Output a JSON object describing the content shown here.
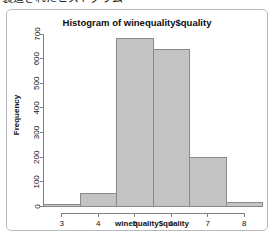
{
  "caption": {
    "text": "製造されたヒストグラム"
  },
  "chart_data": {
    "type": "bar",
    "title": "Histogram of winequality$quality",
    "xlabel": "winequality$quality",
    "ylabel": "Frequency",
    "categories": [
      "3",
      "4",
      "5",
      "6",
      "7",
      "8"
    ],
    "values": [
      10,
      53,
      681,
      638,
      199,
      18
    ],
    "x": [
      3,
      4,
      5,
      6,
      7,
      8
    ],
    "xlim": [
      2.5,
      8.5
    ],
    "ylim": [
      0,
      700
    ],
    "xticks": [
      "3",
      "4",
      "5",
      "6",
      "7",
      "8"
    ],
    "yticks": [
      "0",
      "100",
      "200",
      "300",
      "400",
      "500",
      "600",
      "700"
    ],
    "ytick_values": [
      0,
      100,
      200,
      300,
      400,
      500,
      600,
      700
    ],
    "grid": false,
    "legend": false,
    "bar_fill": "#c4c4c4",
    "bar_stroke": "#8a8a8a",
    "axis_color": "#808080",
    "bar_width": 1
  }
}
